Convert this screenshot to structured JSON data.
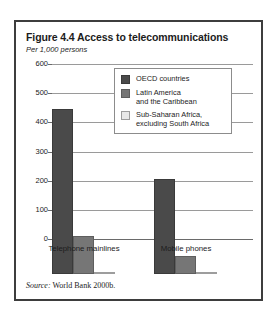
{
  "figure": {
    "title": "Figure 4.4  Access to telecommunications",
    "subtitle": "Per 1,000 persons",
    "source_word": "Source:",
    "source_text": " World Bank 2000b."
  },
  "colors": {
    "series_oecd": "#4a4a4a",
    "series_latin_america": "#767676",
    "series_sub_saharan": "#e2e2e2",
    "frame": "#3d3d3d",
    "gridline": "#9a9a9a"
  },
  "legend": {
    "position": "inside-top-right",
    "items": [
      {
        "label": "OECD countries",
        "label_line2": ""
      },
      {
        "label": "Latin America",
        "label_line2": "and the Caribbean"
      },
      {
        "label": "Sub-Saharan Africa,",
        "label_line2": "excluding South Africa"
      }
    ]
  },
  "chart_data": {
    "type": "bar",
    "title": "Figure 4.4  Access to telecommunications",
    "subtitle": "Per 1,000 persons",
    "xlabel": "",
    "ylabel": "Per 1,000 persons",
    "ylim": [
      0,
      600
    ],
    "yticks": [
      0,
      100,
      200,
      300,
      400,
      500,
      600
    ],
    "ytick_labels": [
      "0",
      "100",
      "200",
      "300",
      "400",
      "500",
      "600"
    ],
    "grid": true,
    "categories": [
      "Telephone mainlines",
      "Mobile phones"
    ],
    "series": [
      {
        "name": "OECD countries",
        "values": [
          565,
          325
        ]
      },
      {
        "name": "Latin America and the Caribbean",
        "values": [
          130,
          62
        ]
      },
      {
        "name": "Sub-Saharan Africa, excluding South Africa",
        "values": [
          8,
          5
        ]
      }
    ],
    "source": "Source: World Bank 2000b."
  }
}
